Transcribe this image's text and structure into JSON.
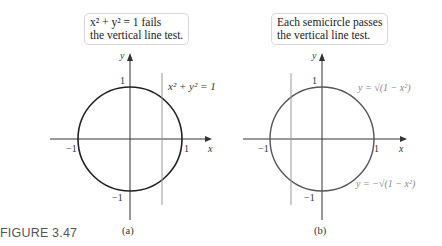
{
  "figure": {
    "caption": "FIGURE 3.47",
    "panels": [
      {
        "id": "a",
        "sublabel": "(a)",
        "callout": [
          "x² + y² = 1 fails",
          "the vertical line test."
        ],
        "curve_label": "x² + y² = 1",
        "axis_labels": {
          "x": "x",
          "y": "y"
        },
        "ticks": {
          "x_neg": "−1",
          "x_pos": "1",
          "y_pos": "1",
          "y_neg": "−1"
        },
        "vertical_line_x": 0.6
      },
      {
        "id": "b",
        "sublabel": "(b)",
        "callout": [
          "Each semicircle passes",
          "the vertical line test."
        ],
        "upper_label": "y = √(1 − x²)",
        "lower_label": "y = −√(1 − x²)",
        "axis_labels": {
          "x": "x",
          "y": "y"
        },
        "ticks": {
          "x_neg": "−1",
          "x_pos": "1",
          "y_pos": "1",
          "y_neg": "−1"
        },
        "vertical_line_x": -0.6
      }
    ]
  },
  "colors": {
    "curve": "#222222",
    "axis": "#333333",
    "vline": "#999999",
    "label_gray": "#888888"
  }
}
